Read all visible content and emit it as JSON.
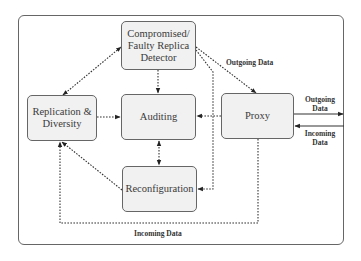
{
  "diagram": {
    "type": "flow-diagram",
    "nodes": {
      "detector": {
        "label": "Compromised/ Faulty Replica Detector",
        "line1": "Compromised/",
        "line2": "Faulty Replica",
        "line3": "Detector"
      },
      "replication": {
        "label": "Replication & Diversity",
        "line1": "Replication &",
        "line2": "Diversity"
      },
      "auditing": {
        "label": "Auditing"
      },
      "proxy": {
        "label": "Proxy"
      },
      "reconfiguration": {
        "label": "Reconfiguration"
      }
    },
    "edge_labels": {
      "detector_to_proxy": "Outgoing Data",
      "proxy_out": {
        "line1": "Outgoing",
        "line2": "Data"
      },
      "proxy_in": {
        "line1": "Incoming",
        "line2": "Data"
      },
      "proxy_to_replication": "Incoming Data"
    },
    "edges": [
      {
        "from": "replication",
        "to": "detector",
        "style": "dashed",
        "direction": "both"
      },
      {
        "from": "detector",
        "to": "auditing",
        "style": "dashed",
        "direction": "forward"
      },
      {
        "from": "detector",
        "to": "proxy",
        "style": "dashed",
        "direction": "forward",
        "label": "Outgoing Data"
      },
      {
        "from": "detector",
        "to": "reconfiguration",
        "style": "dashed",
        "direction": "forward"
      },
      {
        "from": "replication",
        "to": "auditing",
        "style": "dashed",
        "direction": "forward"
      },
      {
        "from": "proxy",
        "to": "auditing",
        "style": "dashed",
        "direction": "forward"
      },
      {
        "from": "auditing",
        "to": "reconfiguration",
        "style": "dashed",
        "direction": "both"
      },
      {
        "from": "reconfiguration",
        "to": "replication",
        "style": "dashed",
        "direction": "forward"
      },
      {
        "from": "proxy",
        "to": "replication",
        "style": "dashed",
        "direction": "forward",
        "label": "Incoming Data"
      },
      {
        "from": "proxy",
        "to": "external",
        "style": "solid",
        "direction": "forward",
        "label": "Outgoing Data"
      },
      {
        "from": "external",
        "to": "proxy",
        "style": "solid",
        "direction": "forward",
        "label": "Incoming Data"
      }
    ]
  }
}
